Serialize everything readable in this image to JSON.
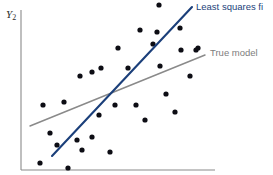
{
  "chart_data": {
    "type": "scatter",
    "title": "",
    "xlabel": "",
    "ylabel": "Y",
    "ylabel_subscript": "2",
    "grid": false,
    "axis": {
      "x_axis": {
        "x1": 21,
        "y1": 170,
        "x2": 215,
        "y2": 170
      },
      "y_axis": {
        "x1": 21,
        "y1": 10,
        "x2": 21,
        "y2": 170
      },
      "color": "#8a8a8a"
    },
    "xlim": [
      21,
      215
    ],
    "ylim": [
      170,
      10
    ],
    "point_color": "#0d0d14",
    "point_radius": 2.6,
    "points": [
      {
        "x": 43,
        "y": 105
      },
      {
        "x": 64,
        "y": 102
      },
      {
        "x": 50,
        "y": 133
      },
      {
        "x": 57,
        "y": 145
      },
      {
        "x": 40,
        "y": 163
      },
      {
        "x": 68,
        "y": 168
      },
      {
        "x": 77,
        "y": 140
      },
      {
        "x": 80,
        "y": 76
      },
      {
        "x": 92,
        "y": 72
      },
      {
        "x": 101,
        "y": 68
      },
      {
        "x": 82,
        "y": 150
      },
      {
        "x": 92,
        "y": 137
      },
      {
        "x": 99,
        "y": 115
      },
      {
        "x": 110,
        "y": 152
      },
      {
        "x": 115,
        "y": 105
      },
      {
        "x": 118,
        "y": 48
      },
      {
        "x": 128,
        "y": 68
      },
      {
        "x": 136,
        "y": 105
      },
      {
        "x": 140,
        "y": 30
      },
      {
        "x": 145,
        "y": 120
      },
      {
        "x": 153,
        "y": 44
      },
      {
        "x": 157,
        "y": 32
      },
      {
        "x": 159,
        "y": 5
      },
      {
        "x": 160,
        "y": 66
      },
      {
        "x": 166,
        "y": 94
      },
      {
        "x": 175,
        "y": 112
      },
      {
        "x": 180,
        "y": 28
      },
      {
        "x": 181,
        "y": 50
      },
      {
        "x": 190,
        "y": 76
      },
      {
        "x": 196,
        "y": 50
      },
      {
        "x": 198,
        "y": 48
      }
    ],
    "series": [
      {
        "name": "Least squares fit",
        "kind": "line",
        "color": "#1b3f7a",
        "x1": 52,
        "y1": 156,
        "x2": 192,
        "y2": 7,
        "label_x": 196,
        "label_y": 2
      },
      {
        "name": "True model",
        "kind": "line",
        "color": "#8a8a8a",
        "x1": 30,
        "y1": 126,
        "x2": 205,
        "y2": 55,
        "label_x": 210,
        "label_y": 48
      }
    ],
    "annotations": [
      {
        "text": "Least squares fi",
        "color": "#2c4f8c",
        "note": "clipped at right image edge"
      },
      {
        "text": "True model",
        "color": "#7d7d7d"
      }
    ]
  },
  "labels": {
    "y_axis": "Y",
    "y_axis_subscript": "2",
    "least_squares_fit": "Least squares fi",
    "true_model": "True model"
  }
}
